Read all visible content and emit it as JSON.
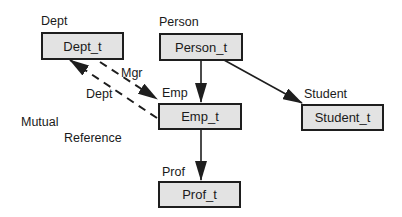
{
  "diagram": {
    "nodes": {
      "dept": {
        "type_name": "Dept",
        "table_name": "Dept_t"
      },
      "person": {
        "type_name": "Person",
        "table_name": "Person_t"
      },
      "emp": {
        "type_name": "Emp",
        "table_name": "Emp_t"
      },
      "student": {
        "type_name": "Student",
        "table_name": "Student_t"
      },
      "prof": {
        "type_name": "Prof",
        "table_name": "Prof_t"
      }
    },
    "edges": {
      "mgr": {
        "label": "Mgr",
        "from": "Dept_t",
        "to": "Emp_t",
        "style": "dashed"
      },
      "dept_ref": {
        "label": "Dept",
        "from": "Emp_t",
        "to": "Dept_t",
        "style": "dashed"
      },
      "person_emp": {
        "from": "Person_t",
        "to": "Emp_t",
        "style": "solid"
      },
      "person_student": {
        "from": "Person_t",
        "to": "Student_t",
        "style": "solid"
      },
      "emp_prof": {
        "from": "Emp_t",
        "to": "Prof_t",
        "style": "solid"
      }
    },
    "annotation": {
      "line1": "Mutual",
      "line2": "Reference"
    }
  },
  "colors": {
    "box_fill": "#e3e3e3",
    "stroke": "#1e1e1e",
    "background": "#ffffff"
  }
}
